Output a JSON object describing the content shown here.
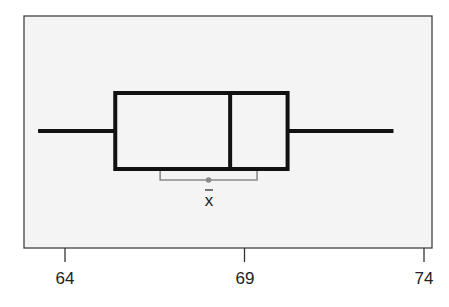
{
  "chart_data": {
    "type": "boxplot",
    "title": "",
    "xlabel": "",
    "ylabel": "",
    "xlim": [
      63.5,
      74.2
    ],
    "ticks": [
      64,
      69,
      74
    ],
    "tick_labels": [
      "64",
      "69",
      "74"
    ],
    "grid": false,
    "legend": null,
    "box": {
      "whisker_low": 63.25,
      "q1": 65.4,
      "median": 68.6,
      "q3": 70.2,
      "whisker_high": 73.15
    },
    "mean_interval": {
      "label": "x̄",
      "mean": 68.0,
      "lower": 66.65,
      "upper": 69.35
    }
  },
  "colors": {
    "plot_bg": "#f4f4f4",
    "box_stroke": "#111111",
    "interval_stroke": "#8a8a8a",
    "axis": "#333333"
  },
  "labels": {
    "tick_64": "64",
    "tick_69": "69",
    "tick_74": "74",
    "mean_symbol": "x̄"
  }
}
